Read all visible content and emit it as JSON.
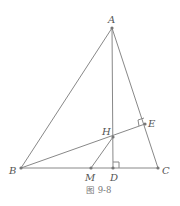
{
  "figure": {
    "caption": "图 9-8",
    "colors": {
      "line": "#888888",
      "label": "#555555"
    },
    "points": {
      "A": {
        "label": "A",
        "x": 112,
        "y": 28
      },
      "B": {
        "label": "B",
        "x": 21,
        "y": 168
      },
      "C": {
        "label": "C",
        "x": 158,
        "y": 168
      },
      "D": {
        "label": "D",
        "x": 113,
        "y": 168
      },
      "E": {
        "label": "E",
        "x": 145,
        "y": 124
      },
      "H": {
        "label": "H",
        "x": 113,
        "y": 137
      },
      "M": {
        "label": "M",
        "x": 91,
        "y": 168
      }
    },
    "segments": [
      "AB",
      "AC",
      "BC",
      "AD",
      "BE",
      "HM"
    ],
    "right_angles": [
      "D",
      "E"
    ]
  }
}
